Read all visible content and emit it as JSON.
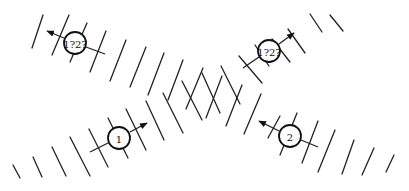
{
  "diagram": {
    "colors": {
      "line": "#222222",
      "background": "#ffffff"
    },
    "nodes": [
      {
        "id": "top-left",
        "label": "1?2?",
        "cx": 75,
        "cy": 43,
        "arrow": "up-left"
      },
      {
        "id": "top-right",
        "label": "1?2?",
        "cx": 269,
        "cy": 51,
        "arrow": "up-right"
      },
      {
        "id": "bottom-left",
        "label": "1",
        "cx": 119,
        "cy": 138,
        "arrow": "right"
      },
      {
        "id": "bottom-right",
        "label": "2",
        "cx": 290,
        "cy": 136,
        "arrow": "left"
      }
    ]
  }
}
